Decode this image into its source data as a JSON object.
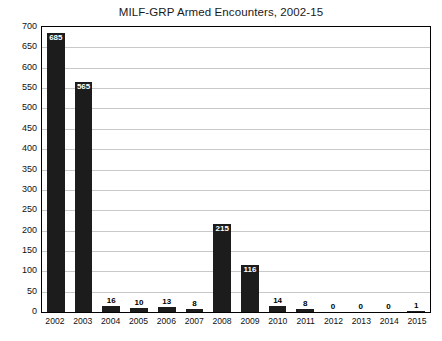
{
  "chart_data": {
    "type": "bar",
    "title": "MILF-GRP Armed Encounters, 2002-15",
    "xlabel": "",
    "ylabel": "",
    "categories": [
      "2002",
      "2003",
      "2004",
      "2005",
      "2006",
      "2007",
      "2008",
      "2009",
      "2010",
      "2011",
      "2012",
      "2013",
      "2014",
      "2015"
    ],
    "values": [
      685,
      565,
      16,
      10,
      13,
      8,
      215,
      116,
      14,
      8,
      0,
      0,
      0,
      1
    ],
    "data_labels": [
      "685",
      "565",
      "16",
      "10",
      "13",
      "8",
      "215",
      "116",
      "14",
      "8",
      "0",
      "0",
      "0",
      "1"
    ],
    "ylim": [
      0,
      700
    ],
    "yticks": [
      0,
      50,
      100,
      150,
      200,
      250,
      300,
      350,
      400,
      450,
      500,
      550,
      600,
      650,
      700
    ],
    "ytick_labels": [
      "0",
      "50",
      "100",
      "150",
      "200",
      "250",
      "300",
      "350",
      "400",
      "450",
      "500",
      "550",
      "600",
      "650",
      "700"
    ],
    "grid": true,
    "legend": false,
    "bar_color": "#1c1c1c",
    "grid_color": "#c9c9c9",
    "axis_color": "#000000",
    "label_color_inside": "#ffffff",
    "background": "#ffffff"
  }
}
